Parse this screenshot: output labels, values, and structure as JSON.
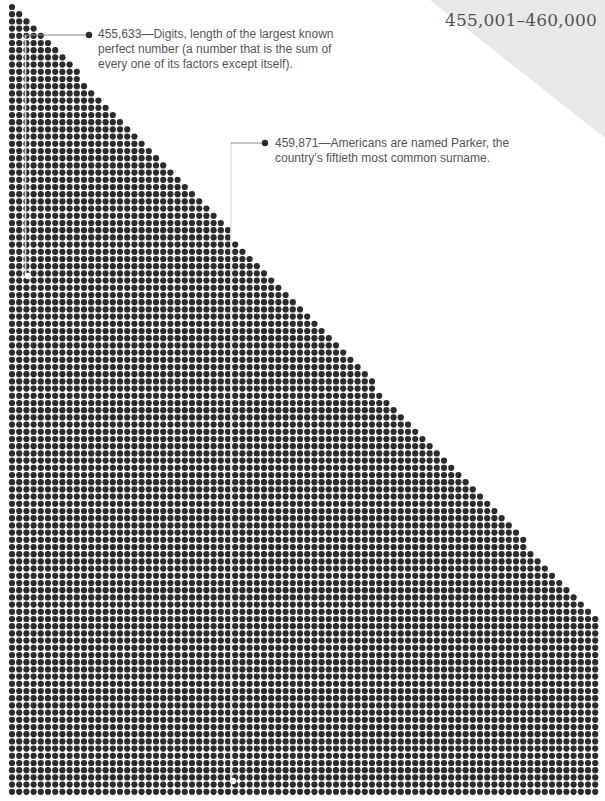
{
  "title": "455,001–460,000",
  "colors": {
    "dot": "#2b2b2b",
    "highlight_dot": "#ffffff",
    "leader_line": "#888888",
    "corner_triangle": "#e8e8e8",
    "text": "#555555"
  },
  "grid": {
    "columns": 82,
    "rows": 110,
    "pitch": 7.2,
    "origin_x": 12,
    "origin_y": 7,
    "dot_radius": 3.1,
    "full_width_row": 86
  },
  "annotations": [
    {
      "number": "455,633",
      "text": "455,633—Digits, length of the largest known perfect number (a number that is the sum of every one of its factors except itself).",
      "line1": "455,633—Digits, length of the largest known",
      "line2": "perfect number (a number that is the sum of",
      "line3": "every one of its factors except itself).",
      "highlight_dot": {
        "x": 28,
        "y": 276
      },
      "leader": {
        "vx": 25.5,
        "hy": 35,
        "bullet_x": 89
      }
    },
    {
      "number": "459,871",
      "text": "459,871—Americans are named Parker, the country's fiftieth most common surname.",
      "line1": "459,871—Americans are named Parker, the",
      "line2": "country's fiftieth most common surname.",
      "highlight_dot": {
        "x": 233,
        "y": 781
      },
      "leader": {
        "vx": 231,
        "hy": 143,
        "bullet_x": 265
      }
    }
  ]
}
